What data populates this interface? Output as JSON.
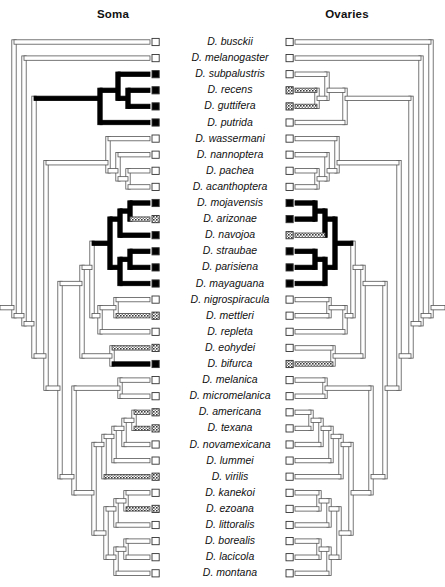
{
  "figure": {
    "type": "phylogenetic-tree-character-mapping",
    "panels": [
      {
        "id": "soma",
        "title": "Soma"
      },
      {
        "id": "ovaries",
        "title": "Ovaries"
      }
    ],
    "state_legend": {
      "white": "absent / state 0",
      "gray": "intermediate / polymorphic",
      "black": "present / state 1"
    }
  },
  "taxa": [
    {
      "name": "D. busckii",
      "soma": "white",
      "ovaries": "white"
    },
    {
      "name": "D. melanogaster",
      "soma": "white",
      "ovaries": "white"
    },
    {
      "name": "D. subpalustris",
      "soma": "black",
      "ovaries": "white"
    },
    {
      "name": "D. recens",
      "soma": "black",
      "ovaries": "gray"
    },
    {
      "name": "D. guttifera",
      "soma": "black",
      "ovaries": "gray"
    },
    {
      "name": "D. putrida",
      "soma": "black",
      "ovaries": "white"
    },
    {
      "name": "D. wassermani",
      "soma": "white",
      "ovaries": "white"
    },
    {
      "name": "D. nannoptera",
      "soma": "white",
      "ovaries": "white"
    },
    {
      "name": "D. pachea",
      "soma": "white",
      "ovaries": "white"
    },
    {
      "name": "D. acanthoptera",
      "soma": "white",
      "ovaries": "white"
    },
    {
      "name": "D. mojavensis",
      "soma": "black",
      "ovaries": "black"
    },
    {
      "name": "D. arizonae",
      "soma": "gray",
      "ovaries": "black"
    },
    {
      "name": "D. navojoa",
      "soma": "black",
      "ovaries": "gray"
    },
    {
      "name": "D. straubae",
      "soma": "black",
      "ovaries": "black"
    },
    {
      "name": "D. parisiena",
      "soma": "black",
      "ovaries": "black"
    },
    {
      "name": "D. mayaguana",
      "soma": "black",
      "ovaries": "black"
    },
    {
      "name": "D. nigrospiracula",
      "soma": "white",
      "ovaries": "white"
    },
    {
      "name": "D. mettleri",
      "soma": "gray",
      "ovaries": "white"
    },
    {
      "name": "D. repleta",
      "soma": "white",
      "ovaries": "white"
    },
    {
      "name": "D. eohydei",
      "soma": "gray",
      "ovaries": "white"
    },
    {
      "name": "D. bifurca",
      "soma": "black",
      "ovaries": "gray"
    },
    {
      "name": "D. melanica",
      "soma": "white",
      "ovaries": "white"
    },
    {
      "name": "D. micromelanica",
      "soma": "white",
      "ovaries": "white"
    },
    {
      "name": "D. americana",
      "soma": "gray",
      "ovaries": "white"
    },
    {
      "name": "D. texana",
      "soma": "gray",
      "ovaries": "white"
    },
    {
      "name": "D. novamexicana",
      "soma": "white",
      "ovaries": "white"
    },
    {
      "name": "D. lummei",
      "soma": "white",
      "ovaries": "white"
    },
    {
      "name": "D. virilis",
      "soma": "gray",
      "ovaries": "white"
    },
    {
      "name": "D. kanekoi",
      "soma": "white",
      "ovaries": "white"
    },
    {
      "name": "D. ezoana",
      "soma": "gray",
      "ovaries": "white"
    },
    {
      "name": "D. littoralis",
      "soma": "white",
      "ovaries": "white"
    },
    {
      "name": "D. borealis",
      "soma": "white",
      "ovaries": "white"
    },
    {
      "name": "D. lacicola",
      "soma": "white",
      "ovaries": "white"
    },
    {
      "name": "D. montana",
      "soma": "white",
      "ovaries": "white"
    }
  ],
  "chart_data": {
    "type": "tree",
    "n_taxa": 34,
    "row_spacing_px": 16.1,
    "first_row_y_px": 42,
    "tip_states": {
      "soma": [
        "white",
        "white",
        "black",
        "black",
        "black",
        "black",
        "white",
        "white",
        "white",
        "white",
        "black",
        "gray",
        "black",
        "black",
        "black",
        "black",
        "white",
        "gray",
        "white",
        "gray",
        "black",
        "white",
        "white",
        "gray",
        "gray",
        "white",
        "white",
        "gray",
        "white",
        "gray",
        "white",
        "white",
        "white",
        "white"
      ],
      "ovaries": [
        "white",
        "white",
        "white",
        "gray",
        "gray",
        "white",
        "white",
        "white",
        "white",
        "white",
        "black",
        "black",
        "gray",
        "black",
        "black",
        "black",
        "white",
        "white",
        "white",
        "white",
        "gray",
        "white",
        "white",
        "white",
        "white",
        "white",
        "white",
        "white",
        "white",
        "white",
        "white",
        "white",
        "white",
        "white"
      ]
    },
    "internal_branch_states": {
      "soma": {
        "quinaria_clade": "black",
        "mulleri_clade": "black",
        "repleta_stem": "white",
        "virilis_clade": "white"
      },
      "ovaries": {
        "quinaria_clade": "white",
        "mulleri_clade": "black",
        "repleta_stem": "white",
        "virilis_clade": "white"
      }
    }
  }
}
